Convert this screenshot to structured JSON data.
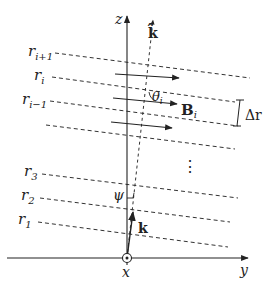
{
  "diagram": {
    "type": "physics-geometry",
    "axes": {
      "z_label": "z",
      "y_label": "y",
      "x_label": "x",
      "x_symbol": "out-of-page (circled dot)"
    },
    "layers": [
      {
        "id": "r_ip1",
        "label": "r",
        "sub": "i+1"
      },
      {
        "id": "r_i",
        "label": "r",
        "sub": "i"
      },
      {
        "id": "r_im1",
        "label": "r",
        "sub": "i−1"
      },
      {
        "id": "r_3",
        "label": "r",
        "sub": "3"
      },
      {
        "id": "r_2",
        "label": "r",
        "sub": "2"
      },
      {
        "id": "r_1",
        "label": "r",
        "sub": "1"
      }
    ],
    "vectors": {
      "k_hat_label": "k̂",
      "k_label": "k",
      "B_label": "B",
      "B_sub": "i"
    },
    "angles": {
      "theta_label": "θ",
      "theta_sub": "i",
      "psi_label": "ψ"
    },
    "spacing_label": "Δr",
    "ellipsis": "⋮",
    "colors": {
      "stroke": "#222222",
      "background": "#ffffff"
    }
  }
}
